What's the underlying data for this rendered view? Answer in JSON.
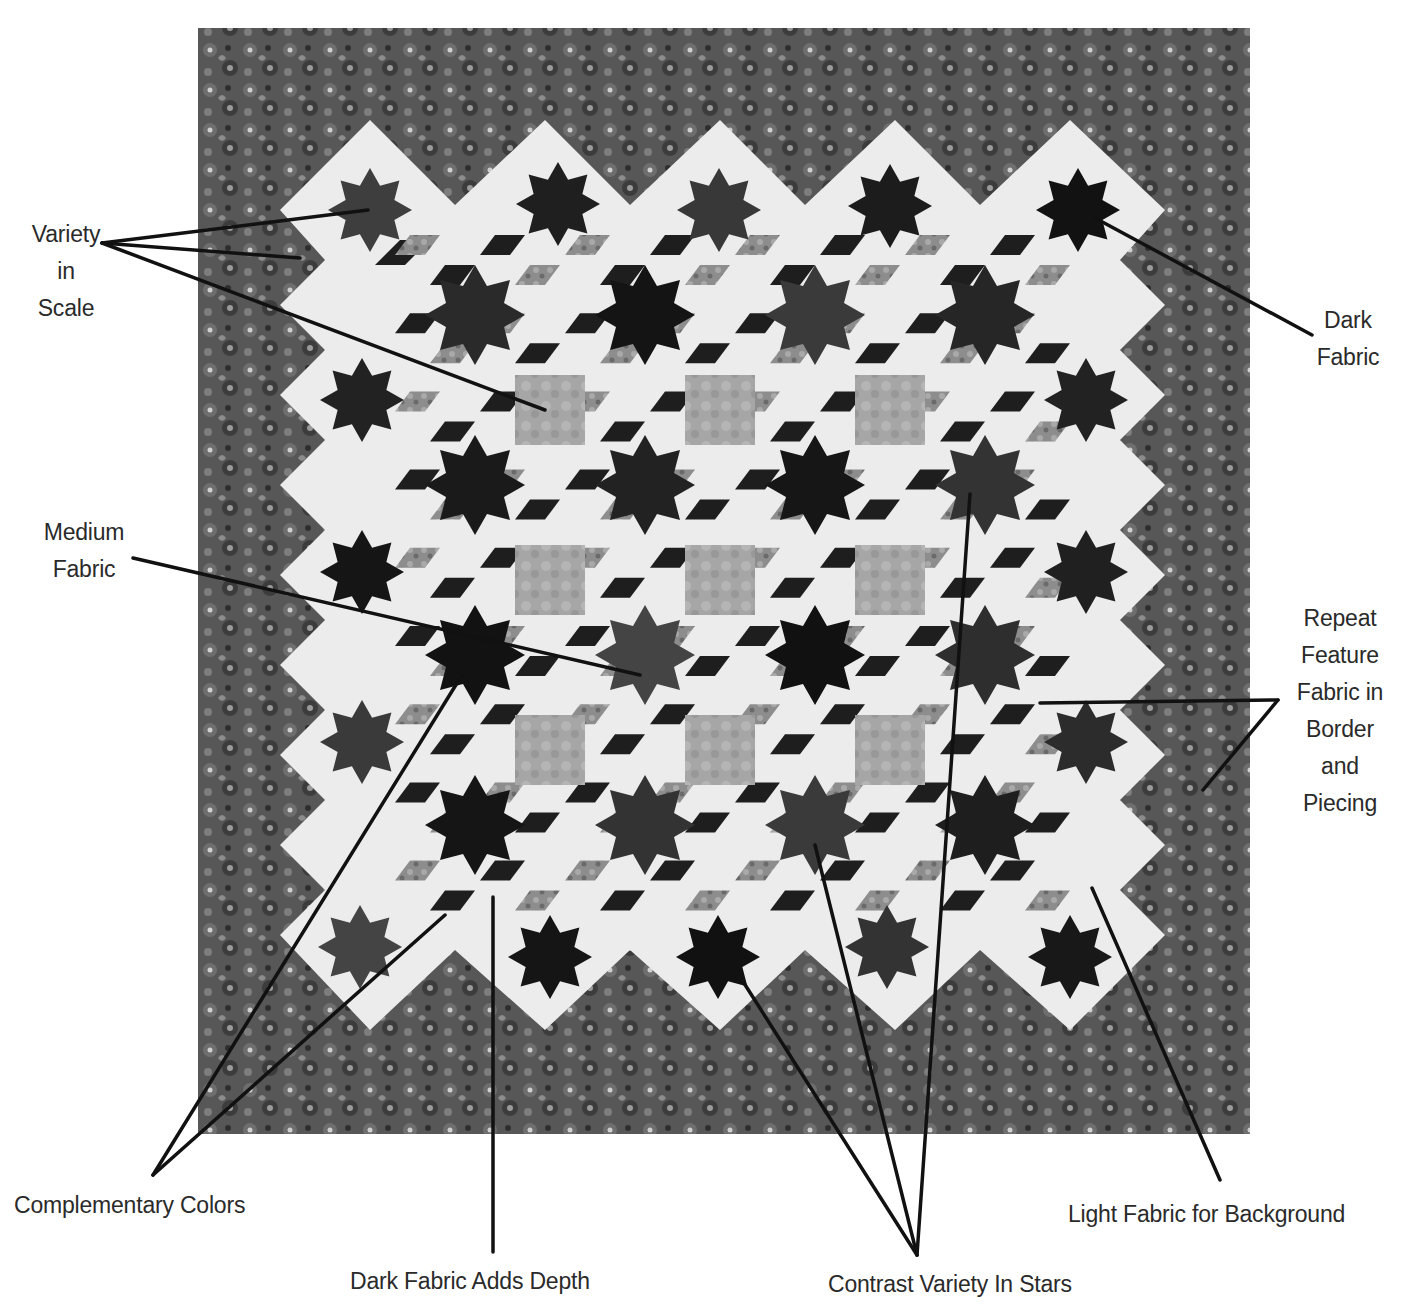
{
  "figure": {
    "page_number_fragment": "00?",
    "quilt": {
      "colors": {
        "border": "#5a5a5a",
        "border_dark": "#3a3a3a",
        "background_light": "#ececec",
        "star_dark": "#1e1e1e",
        "star_medium": "#4a4a4a",
        "diamond_print": "#8a8a8a",
        "center_block": "#a8a8a8",
        "leader_line": "#111111"
      },
      "outer_star_rows": 5,
      "outer_star_cols": 5,
      "center_blocks_grid": [
        3,
        3
      ]
    }
  },
  "callouts": [
    {
      "id": "variety-in-scale",
      "lines": [
        "Variety",
        "in",
        "Scale"
      ]
    },
    {
      "id": "dark-fabric",
      "lines": [
        "Dark",
        "Fabric"
      ]
    },
    {
      "id": "medium-fabric",
      "lines": [
        "Medium",
        "Fabric"
      ]
    },
    {
      "id": "repeat-feature",
      "lines": [
        "Repeat",
        "Feature",
        "Fabric in",
        "Border",
        "and",
        "Piecing"
      ]
    },
    {
      "id": "complementary-colors",
      "lines": [
        "Complementary Colors"
      ]
    },
    {
      "id": "dark-fabric-adds-depth",
      "lines": [
        "Dark Fabric Adds Depth"
      ]
    },
    {
      "id": "contrast-variety-in-stars",
      "lines": [
        "Contrast Variety In Stars"
      ]
    },
    {
      "id": "light-fabric-background",
      "lines": [
        "Light Fabric for Background"
      ]
    }
  ]
}
